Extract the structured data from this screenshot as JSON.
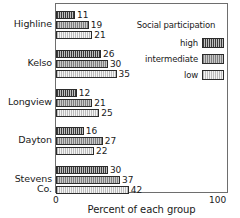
{
  "chart_data": {
    "type": "bar",
    "orientation": "horizontal",
    "title": "",
    "xlabel": "Percent of each group",
    "ylabel": "",
    "xlim": [
      0,
      100
    ],
    "xticks": [
      "0",
      "100"
    ],
    "grid": false,
    "legend": {
      "title": "Social participation",
      "position": "top-right-inside",
      "entries": [
        {
          "name": "high",
          "color": "#3a3a3a",
          "pattern": "vertical-hatch-dark"
        },
        {
          "name": "intermediate",
          "color": "#9a9a9a",
          "pattern": "vertical-hatch-mid"
        },
        {
          "name": "low",
          "color": "#f4f4f4",
          "pattern": "vertical-hatch-light"
        }
      ]
    },
    "categories": [
      "Highline",
      "Kelso",
      "Longview",
      "Dayton",
      "Stevens Co."
    ],
    "series": [
      {
        "name": "high",
        "values": [
          11,
          26,
          12,
          16,
          30
        ]
      },
      {
        "name": "intermediate",
        "values": [
          19,
          30,
          21,
          27,
          37
        ]
      },
      {
        "name": "low",
        "values": [
          21,
          35,
          25,
          22,
          42
        ]
      }
    ]
  },
  "axis": {
    "tick_min": "0",
    "tick_max": "100",
    "label": "Percent of each group"
  },
  "legend": {
    "title": "Social participation",
    "items": [
      {
        "label": "high"
      },
      {
        "label": "intermediate"
      },
      {
        "label": "low"
      }
    ]
  },
  "groups": [
    {
      "category": "Highline",
      "bars": [
        {
          "series": "high",
          "value": 11,
          "label": "11"
        },
        {
          "series": "intermediate",
          "value": 19,
          "label": "19"
        },
        {
          "series": "low",
          "value": 21,
          "label": "21"
        }
      ]
    },
    {
      "category": "Kelso",
      "bars": [
        {
          "series": "high",
          "value": 26,
          "label": "26"
        },
        {
          "series": "intermediate",
          "value": 30,
          "label": "30"
        },
        {
          "series": "low",
          "value": 35,
          "label": "35"
        }
      ]
    },
    {
      "category": "Longview",
      "bars": [
        {
          "series": "high",
          "value": 12,
          "label": "12"
        },
        {
          "series": "intermediate",
          "value": 21,
          "label": "21"
        },
        {
          "series": "low",
          "value": 25,
          "label": "25"
        }
      ]
    },
    {
      "category": "Dayton",
      "bars": [
        {
          "series": "high",
          "value": 16,
          "label": "16"
        },
        {
          "series": "intermediate",
          "value": 27,
          "label": "27"
        },
        {
          "series": "low",
          "value": 22,
          "label": "22"
        }
      ]
    },
    {
      "category": "Stevens Co.",
      "bars": [
        {
          "series": "high",
          "value": 30,
          "label": "30"
        },
        {
          "series": "intermediate",
          "value": 37,
          "label": "37"
        },
        {
          "series": "low",
          "value": 42,
          "label": "42"
        }
      ]
    }
  ]
}
